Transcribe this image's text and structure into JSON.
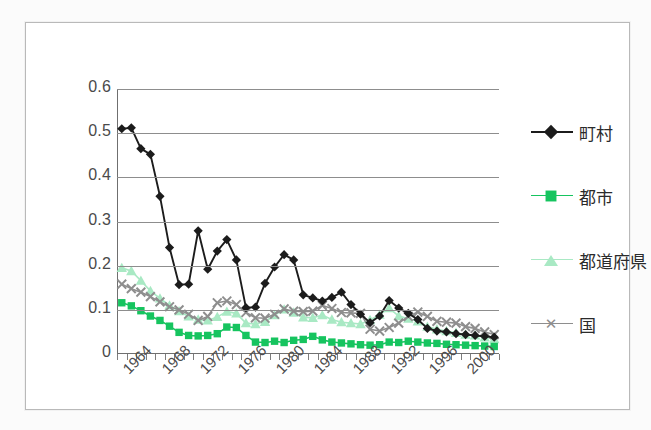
{
  "chart_data": {
    "type": "line",
    "title": "",
    "xlabel": "",
    "ylabel": "",
    "ylim": [
      0,
      0.6
    ],
    "yticks": [
      "0",
      "0.1",
      "0.2",
      "0.3",
      "0.4",
      "0.5",
      "0.6"
    ],
    "grid": true,
    "legend_position": "right",
    "x": [
      1963,
      1964,
      1965,
      1966,
      1967,
      1968,
      1969,
      1970,
      1971,
      1972,
      1973,
      1974,
      1975,
      1976,
      1977,
      1978,
      1979,
      1980,
      1981,
      1982,
      1983,
      1984,
      1985,
      1986,
      1987,
      1988,
      1989,
      1990,
      1991,
      1992,
      1993,
      1994,
      1995,
      1996,
      1997,
      1998,
      1999,
      2000,
      2001,
      2002
    ],
    "xtick_labels": [
      "1964",
      "1968",
      "1972",
      "1976",
      "1980",
      "1984",
      "1988",
      "1992",
      "1996",
      "2000"
    ],
    "xtick_values": [
      1964,
      1968,
      1972,
      1976,
      1980,
      1984,
      1988,
      1992,
      1996,
      2000
    ],
    "series": [
      {
        "name": "町村",
        "color": "#1c1c1c",
        "marker": "diamond",
        "values": [
          0.51,
          0.512,
          0.465,
          0.452,
          0.357,
          0.241,
          0.157,
          0.158,
          0.279,
          0.192,
          0.233,
          0.259,
          0.213,
          0.105,
          0.106,
          0.16,
          0.197,
          0.225,
          0.213,
          0.134,
          0.127,
          0.12,
          0.128,
          0.14,
          0.112,
          0.09,
          0.071,
          0.086,
          0.121,
          0.104,
          0.092,
          0.078,
          0.058,
          0.052,
          0.05,
          0.046,
          0.044,
          0.042,
          0.04,
          0.038
        ]
      },
      {
        "name": "都市",
        "color": "#16c45f",
        "marker": "square",
        "values": [
          0.116,
          0.109,
          0.098,
          0.086,
          0.076,
          0.063,
          0.049,
          0.042,
          0.041,
          0.042,
          0.046,
          0.061,
          0.06,
          0.042,
          0.027,
          0.026,
          0.029,
          0.026,
          0.031,
          0.033,
          0.04,
          0.032,
          0.027,
          0.025,
          0.023,
          0.021,
          0.02,
          0.021,
          0.027,
          0.026,
          0.029,
          0.027,
          0.025,
          0.024,
          0.022,
          0.021,
          0.02,
          0.019,
          0.018,
          0.017
        ]
      },
      {
        "name": "都道府県",
        "color": "#a9e9c4",
        "marker": "triangle",
        "values": [
          0.195,
          0.188,
          0.166,
          0.143,
          0.126,
          0.11,
          0.097,
          0.085,
          0.078,
          0.076,
          0.084,
          0.096,
          0.092,
          0.07,
          0.068,
          0.073,
          0.088,
          0.101,
          0.094,
          0.083,
          0.082,
          0.088,
          0.078,
          0.072,
          0.07,
          0.068,
          0.077,
          0.089,
          0.104,
          0.086,
          0.08,
          0.074,
          0.062,
          0.056,
          0.052,
          0.048,
          0.044,
          0.042,
          0.038,
          0.034
        ]
      },
      {
        "name": "国",
        "color": "#8e8e8e",
        "marker": "x",
        "values": [
          0.158,
          0.148,
          0.14,
          0.13,
          0.118,
          0.107,
          0.1,
          0.09,
          0.076,
          0.085,
          0.116,
          0.12,
          0.112,
          0.094,
          0.082,
          0.081,
          0.09,
          0.102,
          0.097,
          0.096,
          0.097,
          0.11,
          0.103,
          0.094,
          0.093,
          0.092,
          0.056,
          0.052,
          0.06,
          0.07,
          0.085,
          0.095,
          0.085,
          0.074,
          0.072,
          0.07,
          0.062,
          0.058,
          0.05,
          0.044
        ]
      }
    ]
  }
}
